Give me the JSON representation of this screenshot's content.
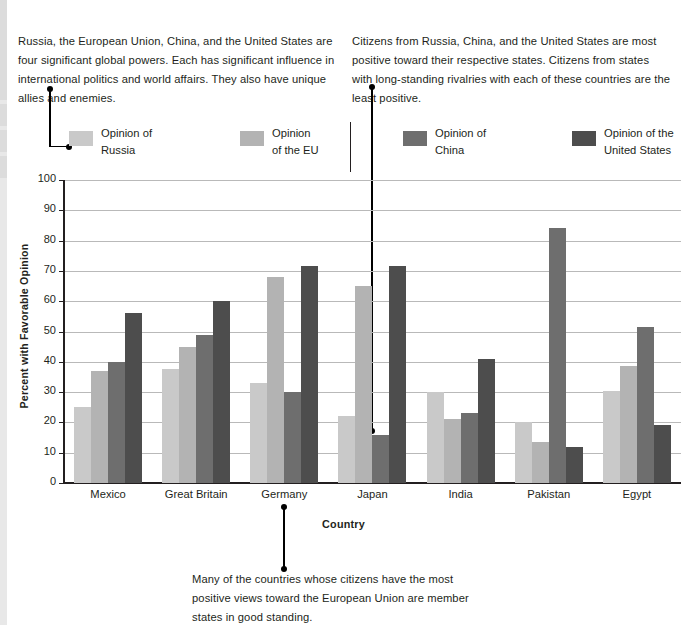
{
  "notes": {
    "left": "Russia, the European Union, China, and the United States are four significant global powers. Each has significant influence in international politics and world affairs. They also have unique allies and enemies.",
    "right": "Citizens from Russia, China, and the United States are most positive toward their respective states. Citizens from states with long-standing rivalries with each of these countries are the least positive.",
    "bottom": "Many of the countries whose citizens have the most positive views toward the European Union are member states in good standing."
  },
  "legend": [
    {
      "line1": "Opinion of",
      "line2": "Russia",
      "color": "#c9c9c9"
    },
    {
      "line1": "Opinion",
      "line2": "of the EU",
      "color": "#b3b3b3"
    },
    {
      "line1": "Opinion of",
      "line2": "China",
      "color": "#6e6e6e"
    },
    {
      "line1": "Opinion of the",
      "line2": "United States",
      "color": "#4d4d4d"
    }
  ],
  "chart_data": {
    "type": "bar",
    "title": "",
    "xlabel": "Country",
    "ylabel": "Percent with Favorable Opinion",
    "ylim": [
      0,
      100
    ],
    "ytick_step": 10,
    "yticks": [
      0,
      10,
      20,
      30,
      40,
      50,
      60,
      70,
      80,
      90,
      100
    ],
    "grid": true,
    "legend_position": "top",
    "categories": [
      "Mexico",
      "Great Britain",
      "Germany",
      "Japan",
      "India",
      "Pakistan",
      "Egypt"
    ],
    "series": [
      {
        "name": "Opinion of Russia",
        "color": "#c9c9c9",
        "values": [
          25,
          37.5,
          33,
          22,
          30,
          20,
          30.5
        ]
      },
      {
        "name": "Opinion of the EU",
        "color": "#b3b3b3",
        "values": [
          37,
          45,
          68,
          65,
          21,
          13.5,
          38.5
        ]
      },
      {
        "name": "Opinion of China",
        "color": "#6e6e6e",
        "values": [
          40,
          49,
          30,
          16,
          23,
          84,
          51.5
        ]
      },
      {
        "name": "Opinion of the United States",
        "color": "#4d4d4d",
        "values": [
          56,
          60,
          71.5,
          71.5,
          41,
          12,
          19
        ]
      }
    ],
    "annotations": [
      {
        "name": "eu-callout",
        "text_ref": "notes.bottom",
        "points_to": "Germany group"
      },
      {
        "name": "russia-callout",
        "text_ref": "notes.left",
        "points_to": "Opinion of Russia legend swatch"
      },
      {
        "name": "china-callout",
        "text_ref": "notes.right",
        "points_to": "Japan / Opinion of China bar (16)"
      }
    ]
  }
}
